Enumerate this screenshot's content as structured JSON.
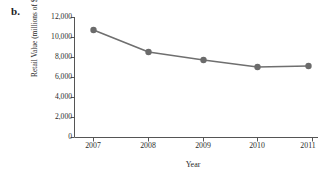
{
  "panel": {
    "label": "b."
  },
  "chart_data": {
    "type": "line",
    "title": "",
    "xlabel": "Year",
    "ylabel": "Retail Value (millions of $)",
    "categories": [
      "2007",
      "2008",
      "2009",
      "2010",
      "2011"
    ],
    "x": [
      2007,
      2008,
      2009,
      2010,
      2011
    ],
    "values": [
      10700,
      8500,
      7700,
      7000,
      7100
    ],
    "series": [
      {
        "name": "Retail Value",
        "values": [
          10700,
          8500,
          7700,
          7000,
          7100
        ]
      }
    ],
    "ylim": [
      0,
      12000
    ],
    "yticks": [
      0,
      2000,
      4000,
      6000,
      8000,
      10000,
      12000
    ],
    "ytick_labels": [
      "0",
      "2,000",
      "4,000",
      "6,000",
      "8,000",
      "10,000",
      "12,000"
    ],
    "xticks": [
      2007,
      2008,
      2009,
      2010,
      2011
    ],
    "xtick_labels": [
      "2007",
      "2008",
      "2009",
      "2010",
      "2011"
    ],
    "grid": false,
    "legend": false,
    "legend_position": "none",
    "line_color": "#6f6f6f",
    "marker_color": "#6b6b6b",
    "marker": "circle",
    "axis_color": "#555555"
  }
}
